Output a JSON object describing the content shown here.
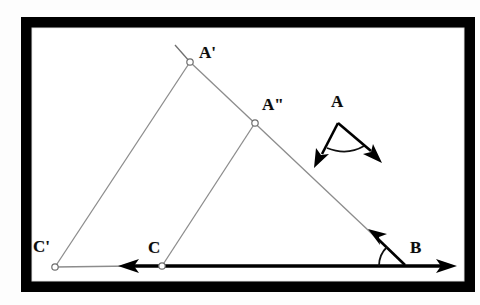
{
  "figure": {
    "background_color": "#fdfdfd",
    "frame": {
      "outer_line_color": "#3a3a3a",
      "band_color": "#000000",
      "gap_color": "#ffffff",
      "interior_color": "#ffffff"
    },
    "stroke_colors": {
      "construction_line": "#8c8c8c",
      "heavy_line": "#000000",
      "vertex_marker_stroke": "#6e6e6e",
      "vertex_marker_fill": "#ffffff",
      "label_color": "#0b0b0b",
      "arc_color": "#111111"
    },
    "points": [
      {
        "id": "A-prime",
        "label": "A'",
        "x": 190,
        "y": 62,
        "label_x": 199,
        "label_y": 44,
        "marker": true
      },
      {
        "id": "A-double",
        "label": "A\"",
        "x": 255,
        "y": 123,
        "label_x": 262,
        "label_y": 96,
        "marker": true
      },
      {
        "id": "C-prime",
        "label": "C'",
        "x": 55,
        "y": 267,
        "label_x": 33,
        "label_y": 238,
        "marker": true
      },
      {
        "id": "C",
        "label": "C",
        "x": 162,
        "y": 266,
        "label_x": 148,
        "label_y": 239,
        "marker": true
      },
      {
        "id": "B",
        "label": "B",
        "x": 405,
        "y": 265,
        "label_x": 410,
        "label_y": 239,
        "marker": false
      },
      {
        "id": "A-angle",
        "label": "A",
        "x": 338,
        "y": 123,
        "label_x": 331,
        "label_y": 93,
        "marker": false
      }
    ],
    "segments": [
      {
        "id": "seg-Cprime-Aprime",
        "from": "C-prime",
        "to": "A-prime",
        "style": "construction"
      },
      {
        "id": "seg-Aprime-B",
        "from": "A-prime",
        "to": "B",
        "style": "construction"
      },
      {
        "id": "seg-C-Adouble",
        "from": "C",
        "to": "A-double",
        "style": "construction"
      },
      {
        "id": "seg-baseline",
        "from": "C-prime",
        "to": "B",
        "style": "heavy-ray"
      }
    ],
    "ray_stub": {
      "id": "stub-above-Aprime",
      "x1": 190,
      "y1": 62,
      "x2": 176,
      "y2": 46
    },
    "arrowheads": [
      {
        "id": "baseline-right-arrow",
        "at_x": 455,
        "at_y": 266,
        "direction": "right"
      },
      {
        "id": "baseline-left-arrow",
        "at_x": 122,
        "at_y": 266,
        "direction": "left"
      },
      {
        "id": "slant-up-left-arrow",
        "at_x": 372,
        "at_y": 232,
        "direction": "up-left"
      },
      {
        "id": "angleA-left-arrow",
        "at_x": 318,
        "at_y": 161,
        "direction": "down-left"
      },
      {
        "id": "angleA-right-arrow",
        "at_x": 376,
        "at_y": 158,
        "direction": "down-right"
      }
    ],
    "angle_marks": [
      {
        "id": "angle-arc-at-B",
        "vertex_x": 405,
        "vertex_y": 265,
        "radius": 26
      },
      {
        "id": "angle-arc-at-A",
        "vertex_x": 338,
        "vertex_y": 123,
        "radius": 30
      }
    ],
    "angle_figure": {
      "id": "standalone-angle-A",
      "vertex_x": 338,
      "vertex_y": 123,
      "left_ray_x": 318,
      "left_ray_y": 161,
      "right_ray_x": 376,
      "right_ray_y": 158
    }
  }
}
